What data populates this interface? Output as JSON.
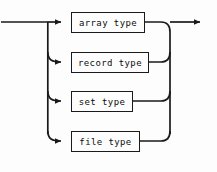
{
  "diagram": {
    "kind": "railroad-syntax-diagram",
    "background_color": "#fdfdfd",
    "line_color": "#1a1a1a",
    "box_fill_color": "#fdfdfd",
    "entry": {
      "name": "entry-rail",
      "from_x": 0,
      "to_x": 47,
      "y": 22
    },
    "exit": {
      "name": "exit-rail",
      "from_x": 170,
      "to_x": 208,
      "y": 22,
      "arrow": "right-arrowhead"
    },
    "left_rail_x": 47,
    "right_rail_x": 170,
    "alternatives": [
      {
        "label": "array type",
        "box_x": 71,
        "box_y": 12,
        "box_w": 74,
        "box_h": 21,
        "row_y": 22,
        "arrow_icon": "right-arrowhead"
      },
      {
        "label": "record type",
        "box_x": 71,
        "box_y": 52,
        "box_w": 78,
        "box_h": 21,
        "row_y": 62,
        "arrow_icon": "right-arrowhead"
      },
      {
        "label": "set type",
        "box_x": 71,
        "box_y": 91,
        "box_w": 62,
        "box_h": 21,
        "row_y": 101,
        "arrow_icon": "right-arrowhead"
      },
      {
        "label": "file type",
        "box_x": 71,
        "box_y": 131,
        "box_w": 69,
        "box_h": 21,
        "row_y": 141,
        "arrow_icon": "right-arrowhead"
      }
    ]
  }
}
